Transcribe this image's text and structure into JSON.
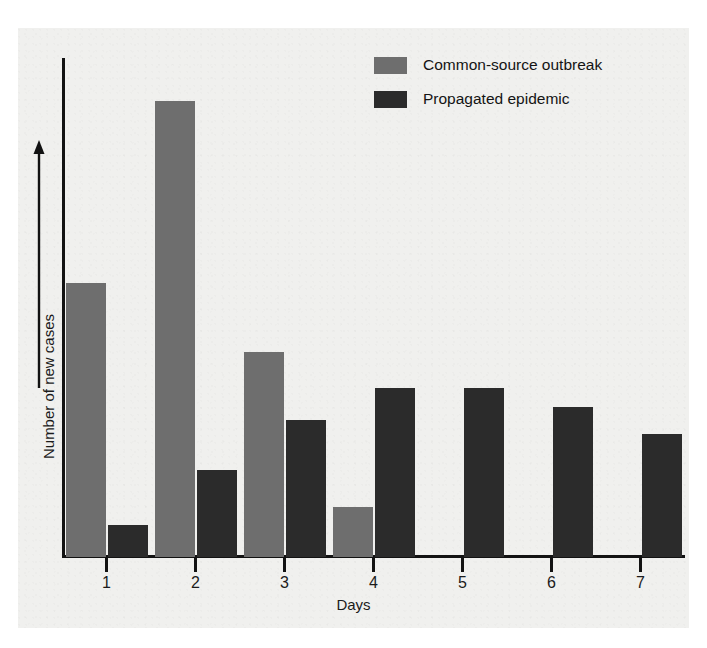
{
  "chart_data": {
    "type": "bar",
    "title": "",
    "subtitle": "",
    "xlabel": "Days",
    "ylabel": "Number of new cases",
    "categories": [
      "1",
      "2",
      "3",
      "4",
      "5",
      "6",
      "7"
    ],
    "grid": false,
    "legend_position": "top-right",
    "axis_notes": "y-axis unlabeled (relative scale, arrow indicates increasing number of new cases)",
    "ylim": [
      0,
      100
    ],
    "series": [
      {
        "name": "Common-source outbreak",
        "color": "#6e6e6e",
        "values": [
          60,
          100,
          45,
          11,
          0,
          0,
          0
        ]
      },
      {
        "name": "Propagated epidemic",
        "color": "#2b2b2b",
        "values": [
          7,
          19,
          30,
          37,
          37,
          33,
          27
        ]
      }
    ]
  },
  "legend": {
    "items": [
      {
        "label": "Common-source outbreak",
        "color": "#6e6e6e"
      },
      {
        "label": "Propagated epidemic",
        "color": "#2b2b2b"
      }
    ]
  },
  "axes": {
    "x_title": "Days",
    "y_title": "Number of new cases",
    "x_ticks": [
      "1",
      "2",
      "3",
      "4",
      "5",
      "6",
      "7"
    ]
  }
}
